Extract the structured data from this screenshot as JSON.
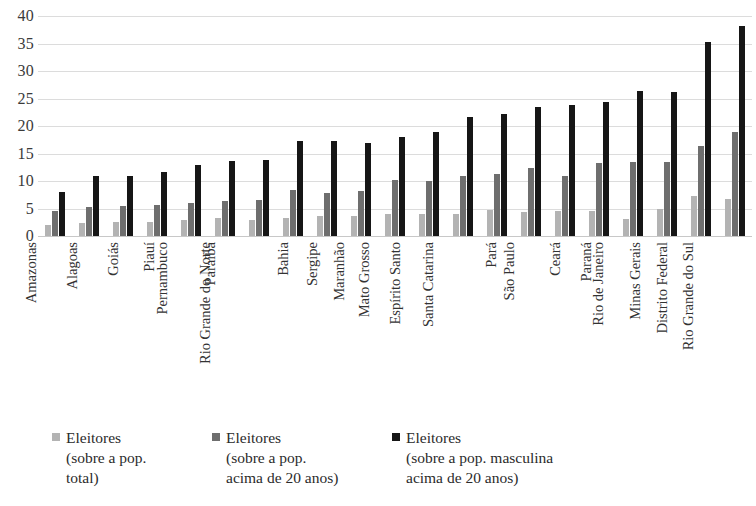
{
  "chart_data": {
    "type": "bar",
    "title": "",
    "subtitle": "",
    "xlabel": "",
    "ylabel": "",
    "ylim": [
      0,
      40
    ],
    "y_ticks": [
      0,
      5,
      10,
      15,
      20,
      25,
      30,
      35,
      40
    ],
    "grid": true,
    "legend_position": "bottom",
    "categories": [
      "Amazonas",
      "Alagoas",
      "Goiás",
      "Piauí",
      "Pernambuco",
      "Paraíba",
      "Rio Grande do Norte",
      "Bahia",
      "Sergipe",
      "Maranhão",
      "Mato Grosso",
      "Espírito Santo",
      "Santa Catarina",
      "Pará",
      "São Paulo",
      "Ceará",
      "Paraná",
      "Rio de Janeiro",
      "Minas Gerais",
      "Distrito Federal",
      "Rio Grande do Sul"
    ],
    "series": [
      {
        "name": "Eleitores (sobre a pop. total)",
        "color": "#b3b3b3",
        "values": [
          2.0,
          2.4,
          2.5,
          2.5,
          3.0,
          3.2,
          3.0,
          3.2,
          3.6,
          3.6,
          4.0,
          4.0,
          4.0,
          4.7,
          4.3,
          4.6,
          4.5,
          3.1,
          5.0,
          7.3,
          6.8
        ]
      },
      {
        "name": "Eleitores (sobre a pop. acima de 20 anos)",
        "color": "#6e6e6e",
        "values": [
          4.6,
          5.3,
          5.4,
          5.6,
          6.0,
          6.4,
          6.5,
          8.3,
          7.8,
          8.1,
          10.2,
          10.0,
          11.0,
          11.2,
          12.4,
          11.0,
          13.3,
          13.4,
          13.4,
          16.3,
          19.0
        ]
      },
      {
        "name": "Eleitores (sobre a pop. masculina acima de 20 anos)",
        "color": "#161616",
        "values": [
          8.0,
          10.9,
          11.0,
          11.6,
          12.9,
          13.7,
          13.8,
          17.3,
          17.2,
          17.0,
          18.0,
          19.0,
          21.6,
          22.2,
          23.4,
          23.9,
          24.4,
          26.4,
          26.1,
          35.2,
          38.2
        ]
      }
    ],
    "legend": [
      {
        "swatch": "s0",
        "lines": [
          "Eleitores",
          "(sobre a pop.",
          "total)"
        ]
      },
      {
        "swatch": "s1",
        "lines": [
          "Eleitores",
          "(sobre a pop.",
          "acima de 20 anos)"
        ]
      },
      {
        "swatch": "s2",
        "lines": [
          "Eleitores",
          "(sobre a pop. masculina",
          "acima de 20 anos)"
        ]
      }
    ]
  }
}
